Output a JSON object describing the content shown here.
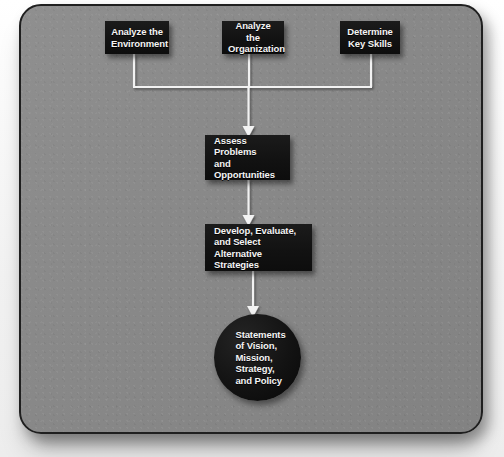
{
  "diagram": {
    "type": "flowchart",
    "title": "",
    "frame": {
      "shape": "rounded-rectangle",
      "fill_color": "#8a8a8a",
      "border_color": "#1f1f1f"
    },
    "node_style": {
      "box_fill": "#121212",
      "text_color": "#ffffff",
      "connector_color": "#ffffff"
    },
    "nodes": [
      {
        "id": "analyze-environment",
        "shape": "rectangle",
        "row": "top",
        "label": "Analyze the\nEnvironment"
      },
      {
        "id": "analyze-organization",
        "shape": "rectangle",
        "row": "top",
        "label": "Analyze the\nOrganization"
      },
      {
        "id": "determine-skills",
        "shape": "rectangle",
        "row": "top",
        "label": "Determine\nKey Skills"
      },
      {
        "id": "assess-problems",
        "shape": "rectangle",
        "row": "middle",
        "label": "Assess Problems\nand\nOpportunities"
      },
      {
        "id": "develop-strategies",
        "shape": "rectangle",
        "row": "middle",
        "label": "Develop, Evaluate,\nand Select\nAlternative Strategies"
      },
      {
        "id": "statements",
        "shape": "circle",
        "row": "terminal",
        "label": "Statements\nof Vision,\nMission,\nStrategy,\nand Policy"
      }
    ],
    "edges": [
      {
        "from": "analyze-environment",
        "to": "assess-problems",
        "style": "elbow-merge"
      },
      {
        "from": "analyze-organization",
        "to": "assess-problems",
        "style": "straight-arrow"
      },
      {
        "from": "determine-skills",
        "to": "assess-problems",
        "style": "elbow-merge"
      },
      {
        "from": "assess-problems",
        "to": "develop-strategies",
        "style": "straight-arrow"
      },
      {
        "from": "develop-strategies",
        "to": "statements",
        "style": "straight-arrow"
      }
    ]
  }
}
